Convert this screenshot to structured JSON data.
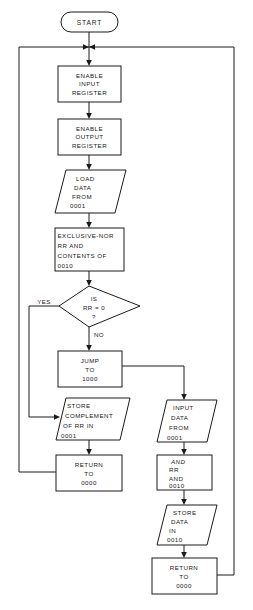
{
  "diagram": {
    "type": "flowchart",
    "background_color": "#ffffff",
    "line_color": "#1a1a1a",
    "shape_fill": "#ffffff"
  },
  "nodes": {
    "start": {
      "shape": "terminator",
      "label": "START"
    },
    "enable_input": {
      "shape": "process",
      "line1": "ENABLE",
      "line2": "INPUT",
      "line3": "REGISTER"
    },
    "enable_output": {
      "shape": "process",
      "line1": "ENABLE",
      "line2": "OUTPUT",
      "line3": "REGISTER"
    },
    "load_data": {
      "shape": "data",
      "line1": "LOAD",
      "line2": "DATA",
      "line3": "FROM",
      "line4": "0001"
    },
    "exclusive_nor": {
      "shape": "process",
      "line1a": "EXCLUSIVE-",
      "line1b": "NOR",
      "line2": "RR AND",
      "line3": "CONTENTS OF",
      "line4": "0010"
    },
    "decision": {
      "shape": "decision",
      "line1": "IS",
      "line2": "RR = 0",
      "line3": "?"
    },
    "jump": {
      "shape": "process",
      "line1": "JUMP",
      "line2": "TO",
      "line3": "1000"
    },
    "store_complement": {
      "shape": "data",
      "line1": "STORE",
      "line2": "COMPLEMENT",
      "line3": "OF RR IN",
      "line4": "0001"
    },
    "return_left": {
      "shape": "process",
      "line1": "RETURN",
      "line2": "TO",
      "line3": "0000"
    },
    "input_data": {
      "shape": "data",
      "line1": "INPUT",
      "line2": "DATA",
      "line3": "FROM",
      "line4": "0001"
    },
    "and_op": {
      "shape": "process",
      "line1": "AND",
      "line2": "RR",
      "line3": "AND",
      "line4": "0010"
    },
    "store_data": {
      "shape": "data",
      "line1": "STORE",
      "line2": "DATA",
      "line3": "IN",
      "line4": "0010"
    },
    "return_right": {
      "shape": "process",
      "line1": "RETURN",
      "line2": "TO",
      "line3": "0000"
    }
  },
  "edges": {
    "yes_label": "YES",
    "no_label": "NO"
  }
}
